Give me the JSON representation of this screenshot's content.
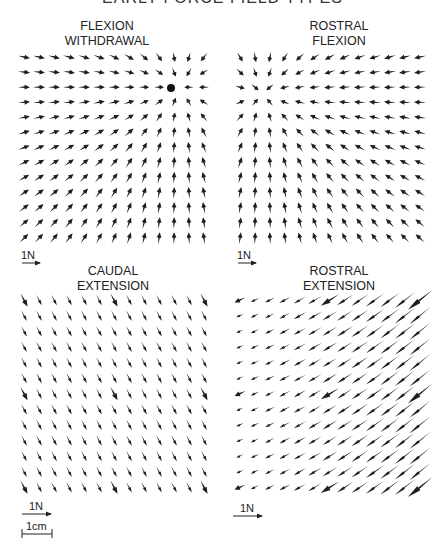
{
  "figure": {
    "title": "EARLY FORCE FIELD TYPES",
    "scale": {
      "force_label": "1N",
      "distance_label": "1cm"
    }
  },
  "chart_data": [
    {
      "type": "quiver",
      "title": "FLEXION WITHDRAWAL",
      "title_lines": [
        "FLEXION",
        "WITHDRAWAL"
      ],
      "grid": {
        "cols": 13,
        "rows": 13,
        "x0": 24,
        "y0": 57,
        "dx": 15,
        "dy": 15.1
      },
      "equilibrium_point": {
        "col": 10.4,
        "row": 2.0
      },
      "description": "Convergent field: arrows point toward an equilibrium point near top-right (marked by a dot); bottom/left vectors point up and rightward, top-left vectors point right.",
      "scale_bar": "1N",
      "field": "convergent"
    },
    {
      "type": "quiver",
      "title": "ROSTRAL FLEXION",
      "title_lines": [
        "ROSTRAL",
        "FLEXION"
      ],
      "grid": {
        "cols": 13,
        "rows": 13,
        "x0": 240,
        "y0": 57,
        "dx": 15,
        "dy": 15.1
      },
      "equilibrium_point": {
        "col": 1.5,
        "row": 2.4
      },
      "description": "Convergent field with equilibrium near upper-left; top rows point up-right, row 3 points left, lower vectors point upward tilting left on the right side.",
      "scale_bar": "1N",
      "field": "convergent"
    },
    {
      "type": "quiver",
      "title": "CAUDAL EXTENSION",
      "title_lines": [
        "CAUDAL",
        "EXTENSION"
      ],
      "grid": {
        "cols": 13,
        "rows": 13,
        "x0": 24,
        "y0": 300,
        "dx": 15,
        "dy": 15.6
      },
      "description": "Near-uniform parallel field: all arrows point down-right (~ -62°), nearly equal length.",
      "uniform_angle_deg": -62,
      "scale_bar": "1N",
      "field": "parallel"
    },
    {
      "type": "quiver",
      "title": "ROSTRAL EXTENSION",
      "title_lines": [
        "ROSTRAL",
        "EXTENSION"
      ],
      "grid": {
        "cols": 13,
        "rows": 13,
        "x0": 240,
        "y0": 300,
        "dx": 15,
        "dy": 15.6
      },
      "description": "Parallel field pointing down-left (~ 210°); arrow lengths increase toward the right side.",
      "uniform_angle_deg": 212,
      "scale_bar": "1N",
      "field": "parallel-graded"
    }
  ]
}
